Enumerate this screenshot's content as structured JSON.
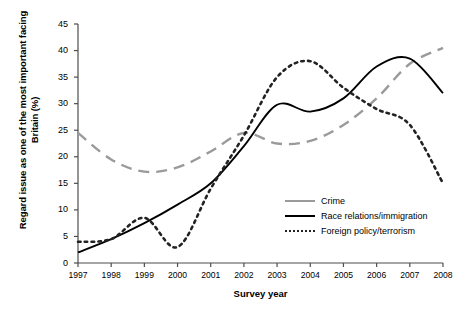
{
  "chart_data": {
    "type": "line",
    "title": "",
    "xlabel": "Survey year",
    "ylabel": "Regard issue as one of the most important facing Britain (%)",
    "x": [
      1997,
      1998,
      1999,
      2000,
      2001,
      2002,
      2003,
      2004,
      2005,
      2006,
      2007,
      2008
    ],
    "xtick_labels": [
      "1997",
      "1998",
      "1999",
      "2000",
      "2001",
      "2002",
      "2003",
      "2004",
      "2005",
      "2006",
      "2007",
      "2008"
    ],
    "ytick_labels": [
      "0",
      "5",
      "10",
      "15",
      "20",
      "25",
      "30",
      "35",
      "40",
      "45"
    ],
    "ylim": [
      0,
      45
    ],
    "xlim": [
      1997,
      2008
    ],
    "grid": false,
    "legend_position": "inside-lower-right",
    "series": [
      {
        "name": "Crime",
        "style": "dashed",
        "color": "#9a9a9a",
        "values": [
          24.5,
          19.5,
          17.2,
          18.0,
          21.0,
          24.5,
          22.5,
          23.0,
          26.0,
          31.0,
          37.5,
          40.5
        ]
      },
      {
        "name": "Race relations/immigration",
        "style": "solid",
        "color": "#000000",
        "values": [
          2.0,
          4.5,
          7.5,
          11.0,
          15.0,
          22.0,
          29.8,
          28.5,
          31.0,
          37.0,
          38.5,
          32.0
        ]
      },
      {
        "name": "Foreign policy/terrorism",
        "style": "dotted",
        "color": "#222222",
        "values": [
          4.0,
          4.5,
          8.5,
          3.0,
          14.0,
          24.0,
          35.0,
          38.0,
          33.0,
          29.0,
          26.0,
          15.0
        ]
      }
    ]
  },
  "legend": {
    "items": [
      {
        "label": "Crime"
      },
      {
        "label": "Race relations/immigration"
      },
      {
        "label": "Foreign policy/terrorism"
      }
    ]
  }
}
